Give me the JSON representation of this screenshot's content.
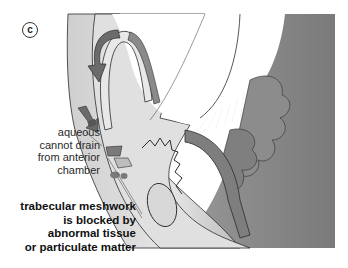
{
  "figure": {
    "panel_label": "c",
    "colors": {
      "background": "#ffffff",
      "cornea_light": "#d9d9d9",
      "sclera_dark": "#8a8a8a",
      "arrow_dark": "#6b6b6b",
      "outline": "#2b2b2b"
    },
    "annotations": [
      {
        "id": "aqueous",
        "lines": [
          "aqueous",
          "cannot drain",
          "from anterior",
          "chamber"
        ]
      },
      {
        "id": "meshwork",
        "lines": [
          "trabecular meshwork",
          "is blocked by",
          "abnormal tissue",
          "or particulate matter"
        ]
      }
    ]
  }
}
